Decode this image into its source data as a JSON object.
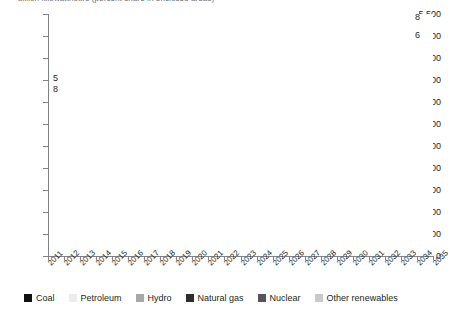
{
  "chart_data": {
    "type": "area",
    "title": "billion kilowatthours (percent share in enclosed areas)",
    "xlabel": "",
    "ylabel": "",
    "ylim": [
      0,
      5500
    ],
    "ytick_labels": [
      "0",
      "500",
      "1,000",
      "1,500",
      "2,000",
      "2,500",
      "3,000",
      "3,500",
      "4,000",
      "4,500",
      "5,000",
      "5,500"
    ],
    "ytick_values": [
      0,
      500,
      1000,
      1500,
      2000,
      2500,
      3000,
      3500,
      4000,
      4500,
      5000,
      5500
    ],
    "grid": false,
    "legend_position": "bottom",
    "stacked": true,
    "categories": [
      "2011",
      "2012",
      "2013",
      "2014",
      "2015",
      "2016",
      "2017",
      "2018",
      "2019",
      "2020",
      "2021",
      "2022",
      "2023",
      "2024",
      "2025",
      "2026",
      "2027",
      "2028",
      "2029",
      "2030",
      "2031",
      "2032",
      "2033",
      "2034",
      "2035"
    ],
    "series": [
      {
        "name": "Coal",
        "color": "#111111",
        "values": [
          1735,
          1640,
          1650,
          1655,
          1640,
          1625,
          1640,
          1650,
          1655,
          1660,
          1665,
          1665,
          1660,
          1655,
          1655,
          1660,
          1665,
          1670,
          1675,
          1680,
          1685,
          1690,
          1695,
          1700,
          1705
        ]
      },
      {
        "name": "Natural gas",
        "color": "#3d3d3d",
        "values": [
          1030,
          1070,
          1075,
          1080,
          1090,
          1100,
          1120,
          1140,
          1165,
          1190,
          1215,
          1245,
          1280,
          1320,
          1365,
          1415,
          1470,
          1530,
          1600,
          1675,
          1760,
          1850,
          1950,
          2060,
          2180
        ]
      },
      {
        "name": "Petroleum",
        "color": "#f2f2f2",
        "values": [
          45,
          44,
          43,
          42,
          42,
          41,
          41,
          40,
          40,
          40,
          40,
          40,
          40,
          40,
          40,
          40,
          40,
          40,
          40,
          40,
          40,
          40,
          40,
          40,
          40
        ]
      },
      {
        "name": "Nuclear",
        "color": "#8a8a8a",
        "values": [
          790,
          795,
          800,
          805,
          810,
          815,
          820,
          825,
          830,
          835,
          840,
          845,
          850,
          855,
          860,
          865,
          870,
          875,
          880,
          885,
          890,
          895,
          900,
          905,
          910
        ]
      },
      {
        "name": "Hydro",
        "color": "#a8a8a8",
        "values": [
          330,
          310,
          312,
          314,
          316,
          318,
          320,
          322,
          324,
          326,
          328,
          328,
          328,
          328,
          328,
          328,
          328,
          328,
          328,
          328,
          328,
          328,
          328,
          328,
          328
        ]
      },
      {
        "name": "Other renewables",
        "color": "#d9d9d9",
        "values": [
          205,
          225,
          250,
          272,
          290,
          305,
          318,
          330,
          342,
          352,
          362,
          372,
          382,
          392,
          402,
          412,
          420,
          428,
          436,
          444,
          450,
          456,
          462,
          468,
          474
        ]
      }
    ],
    "annotations": {
      "left_labels": [
        {
          "series": "Other renewables",
          "value": "5"
        },
        {
          "series": "Hydro",
          "value": "8"
        },
        {
          "series": "Nuclear",
          "value": "19"
        },
        {
          "series": "Natural gas",
          "value": "25"
        },
        {
          "series": "Coal",
          "value": "42"
        }
      ],
      "right_labels": [
        {
          "series": "Other renewables",
          "value": "8"
        },
        {
          "series": "Hydro",
          "value": "6"
        },
        {
          "series": "Nuclear",
          "value": "17"
        },
        {
          "series": "Natural gas",
          "value": "40"
        },
        {
          "series": "Coal",
          "value": "28"
        }
      ]
    },
    "legend": [
      {
        "label": "Coal",
        "color": "#111111"
      },
      {
        "label": "Petroleum",
        "color": "#ececec"
      },
      {
        "label": "Hydro",
        "color": "#a8a8a8"
      },
      {
        "label": "Natural gas",
        "color": "#2e2e2e"
      },
      {
        "label": "Nuclear",
        "color": "#555555"
      },
      {
        "label": "Other renewables",
        "color": "#c9c9c9"
      }
    ]
  }
}
